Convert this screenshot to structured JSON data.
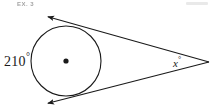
{
  "figure": {
    "name": "circle-with-two-tangents-and-external-angle",
    "background_color": "#ffffff",
    "stroke_color": "#1a1a1a",
    "width": 214,
    "height": 110
  },
  "header": {
    "left_text": "EX. 3",
    "right_text": ""
  },
  "labels": {
    "arc_measure": "210",
    "arc_measure_degree": "°",
    "angle_measure": "x",
    "angle_measure_degree": "°"
  },
  "geometry": {
    "circle": {
      "center_x": 66,
      "center_y": 61,
      "radius": 35,
      "stroke_width": 1.1
    },
    "center_dot": {
      "x": 66,
      "y": 61,
      "radius": 2.6
    },
    "vertex": {
      "x": 209,
      "y": 62
    },
    "upper_tangent": {
      "tangent_point_x": 82,
      "tangent_point_y": 28,
      "arrow_end_x": 49,
      "arrow_end_y": 17
    },
    "lower_tangent": {
      "tangent_point_x": 84,
      "tangent_point_y": 93,
      "arrow_end_x": 49,
      "arrow_end_y": 103
    }
  }
}
